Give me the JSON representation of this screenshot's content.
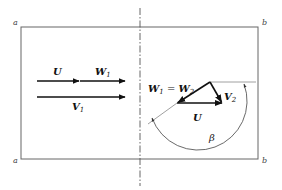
{
  "diagram": {
    "colors": {
      "line": "#555555",
      "vector": "#111111",
      "thin": "#777777"
    },
    "corners": {
      "top_left": "a",
      "top_right": "b",
      "bottom_left": "a",
      "bottom_right": "b"
    },
    "left_vectors": {
      "U": {
        "base": "U",
        "sub": ""
      },
      "W1": {
        "base": "W",
        "sub": "1"
      },
      "V1": {
        "base": "V",
        "sub": "1"
      }
    },
    "right_vectors": {
      "W1_eq_W2": {
        "base1": "W",
        "sub1": "1",
        "eq": " = ",
        "base2": "W",
        "sub2": "2"
      },
      "V2": {
        "base": "V",
        "sub": "2"
      },
      "U": {
        "base": "U",
        "sub": ""
      }
    },
    "angle": {
      "label": "β"
    }
  }
}
